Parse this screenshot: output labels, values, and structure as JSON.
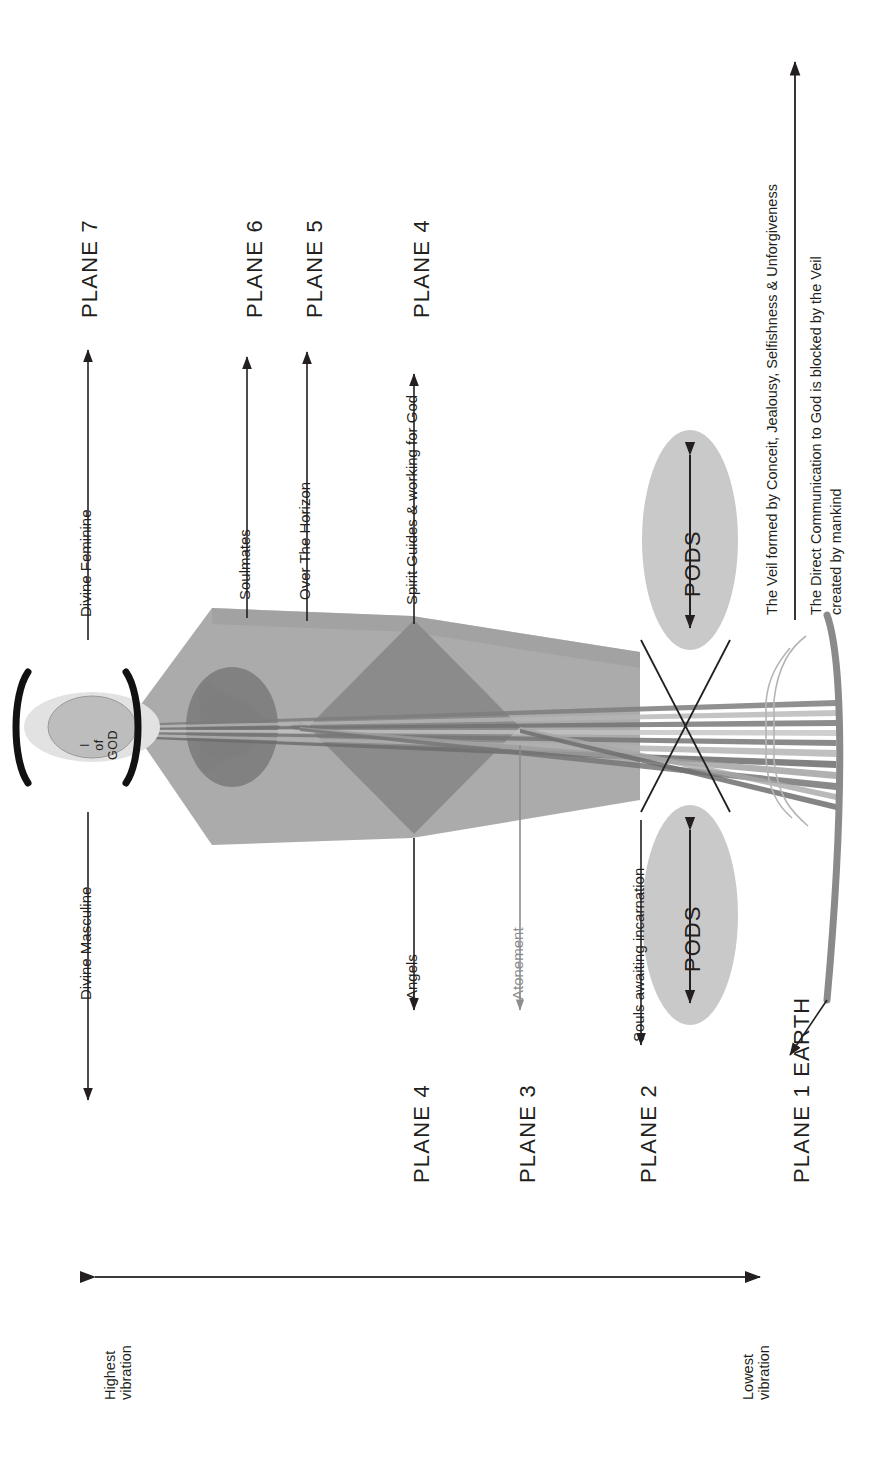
{
  "diagram": {
    "orientation": "rotated-90-ccw",
    "core": {
      "label_line1": "I",
      "label_line2": "of",
      "label_line3": "GOD"
    },
    "planes_right_column": [
      {
        "id": "plane-7",
        "label": "PLANE 7"
      },
      {
        "id": "plane-6",
        "label": "PLANE 6"
      },
      {
        "id": "plane-5",
        "label": "PLANE 5"
      },
      {
        "id": "plane-4-upper",
        "label": "PLANE 4"
      }
    ],
    "planes_left_column": [
      {
        "id": "plane-4-lower",
        "label": "PLANE 4"
      },
      {
        "id": "plane-3",
        "label": "PLANE 3"
      },
      {
        "id": "plane-2",
        "label": "PLANE 2"
      },
      {
        "id": "plane-1",
        "label": "PLANE 1  EARTH"
      }
    ],
    "annotations_upper": [
      {
        "id": "divine-feminine",
        "label": "Divine Feminine"
      },
      {
        "id": "soulmates",
        "label": "Soulmates"
      },
      {
        "id": "over-the-horizon",
        "label": "Over The Horizon"
      },
      {
        "id": "spirit-guides",
        "label": "Spirit Guides & working for God"
      }
    ],
    "annotations_lower": [
      {
        "id": "divine-masculine",
        "label": "Divine Masculine"
      },
      {
        "id": "angels",
        "label": "Angels"
      },
      {
        "id": "atonement",
        "label": "Atonement"
      },
      {
        "id": "souls-awaiting",
        "label": "Souls awaiting incarnation"
      }
    ],
    "pods": [
      {
        "id": "pods-upper",
        "label": "PODS"
      },
      {
        "id": "pods-lower",
        "label": "PODS"
      }
    ],
    "veil_notes": [
      {
        "id": "veil-note",
        "label": "The Veil formed by Conceit, Jealousy, Selfishness & Unforgiveness"
      },
      {
        "id": "direct-communication-note-line1",
        "label": "The Direct Communication to God is blocked by the Veil"
      },
      {
        "id": "direct-communication-note-line2",
        "label": "created by mankind"
      }
    ],
    "vibration_scale": {
      "high_line1": "Highest",
      "high_line2": "vibration",
      "low_line1": "Lowest",
      "low_line2": "vibration"
    },
    "colors": {
      "ink": "#231f20",
      "atonement_gray": "#8d8d8d",
      "funnel_gray": "#9a9a9a",
      "diamond_gray": "#8e8e8e",
      "heart_gray": "#858585",
      "pod_gray": "#c9c9c9",
      "halo_gray": "#dcdcdc",
      "core_gray": "#c0c0c0",
      "earth_gray": "#8a8a8a"
    }
  }
}
